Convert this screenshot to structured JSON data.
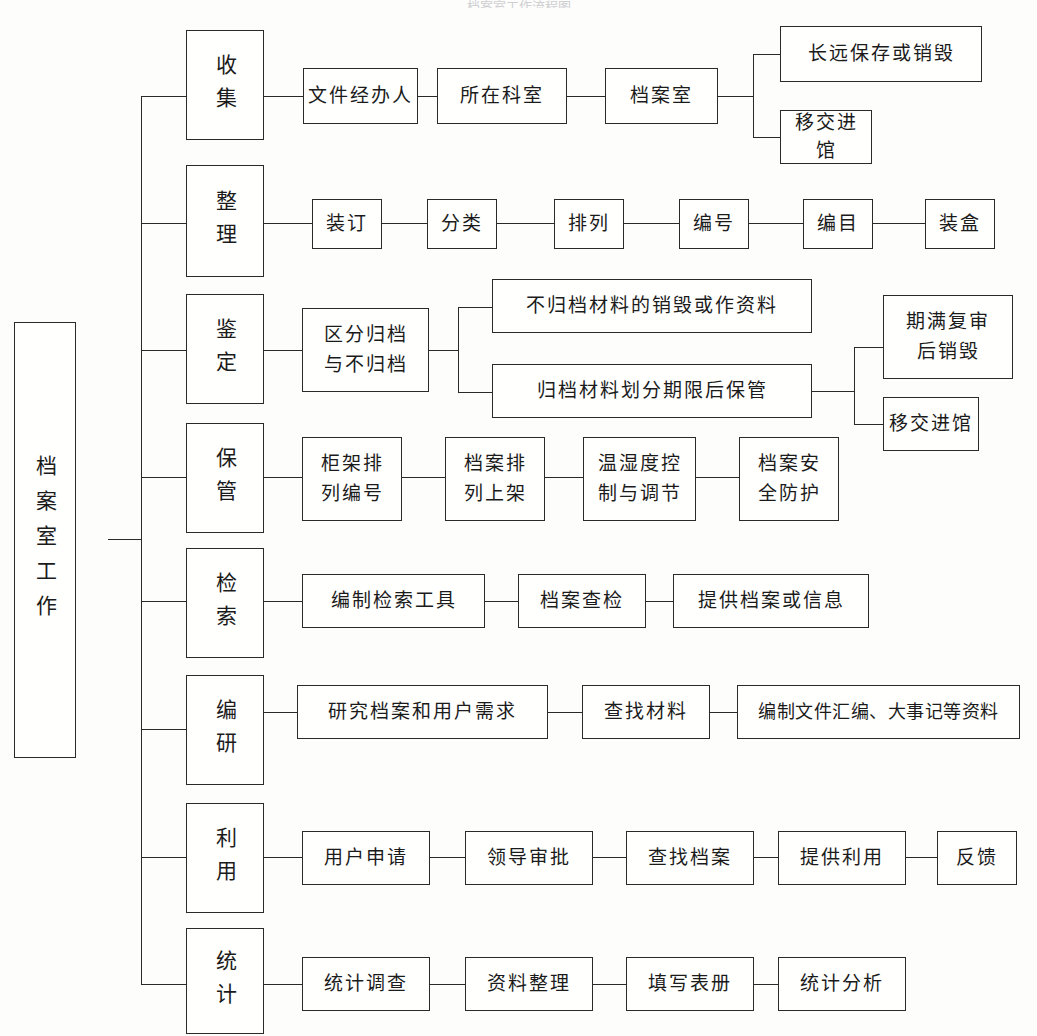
{
  "diagram": {
    "type": "tree-flowchart",
    "title_faint": "档案室工作流程图",
    "root": {
      "label": "档案室工作"
    },
    "branches": [
      {
        "id": "shouji",
        "stage": "收集",
        "chain": [
          "文件经办人",
          "所在科室",
          "档案室"
        ],
        "fork": [
          "长远保存或销毁",
          "移交进馆"
        ]
      },
      {
        "id": "zhengli",
        "stage": "整理",
        "chain": [
          "装订",
          "分类",
          "排列",
          "编号",
          "编目",
          "装盒"
        ],
        "fork": []
      },
      {
        "id": "jianding",
        "stage": "鉴定",
        "chain": [
          "区分归档与不归档"
        ],
        "fork": [
          "不归档材料的销毁或作资料",
          "归档材料划分期限后保管"
        ],
        "subfork": [
          "期满复审后销毁",
          "移交进馆"
        ]
      },
      {
        "id": "baoguan",
        "stage": "保管",
        "chain": [
          "柜架排列编号",
          "档案排列上架",
          "温湿度控制与调节",
          "档案安全防护"
        ],
        "fork": []
      },
      {
        "id": "jiansuo",
        "stage": "检索",
        "chain": [
          "编制检索工具",
          "档案查检",
          "提供档案或信息"
        ],
        "fork": []
      },
      {
        "id": "bianyan",
        "stage": "编研",
        "chain": [
          "研究档案和用户需求",
          "查找材料",
          "编制文件汇编、大事记等资料"
        ],
        "fork": []
      },
      {
        "id": "liyong",
        "stage": "利用",
        "chain": [
          "用户申请",
          "领导审批",
          "查找档案",
          "提供利用",
          "反馈"
        ],
        "fork": []
      },
      {
        "id": "tongji",
        "stage": "统计",
        "chain": [
          "统计调查",
          "资料整理",
          "填写表册",
          "统计分析"
        ],
        "fork": []
      }
    ],
    "stage_labels": {
      "s1": "收集",
      "s2": "整理",
      "s3": "鉴定",
      "s4": "保管",
      "s5": "检索",
      "s6": "编研",
      "s7": "利用",
      "s8": "统计"
    },
    "nodes": {
      "n_wenjian": "文件经办人",
      "n_keshi": "所在科室",
      "n_dangansh": "档案室",
      "n_changyuan": "长远保存或销毁",
      "n_yijiao1": "移交进馆",
      "n_zhuangding": "装订",
      "n_fenlei": "分类",
      "n_pailie": "排列",
      "n_bianhao": "编号",
      "n_bianmu": "编目",
      "n_zhuanghe": "装盒",
      "n_qufen_a": "区分归档",
      "n_qufen_b": "与不归档",
      "n_buguidang": "不归档材料的销毁或作资料",
      "n_guidang": "归档材料划分期限后保管",
      "n_qiman_a": "期满复审",
      "n_qiman_b": "后销毁",
      "n_yijiao2": "移交进馆",
      "n_guijia_a": "柜架排",
      "n_guijia_b": "列编号",
      "n_dangan_a": "档案排",
      "n_dangan_b": "列上架",
      "n_wenshi_a": "温湿度控",
      "n_wenshi_b": "制与调节",
      "n_anquan_a": "档案安",
      "n_anquan_b": "全防护",
      "n_bianzhi": "编制检索工具",
      "n_chajian": "档案查检",
      "n_tigong_info": "提供档案或信息",
      "n_yanjiu": "研究档案和用户需求",
      "n_chazhao_cl": "查找材料",
      "n_bianzhi_wj": "编制文件汇编、大事记等资料",
      "n_yonghu": "用户申请",
      "n_lingdao": "领导审批",
      "n_chazhao_da": "查找档案",
      "n_tigong_ly": "提供利用",
      "n_fankui": "反馈",
      "n_tjdiaocha": "统计调查",
      "n_zlzhengli": "资料整理",
      "n_tianxie": "填写表册",
      "n_tjfenxi": "统计分析"
    }
  }
}
